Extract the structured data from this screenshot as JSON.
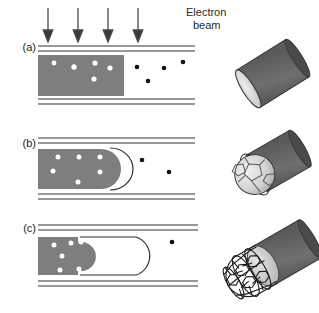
{
  "figure": {
    "type": "schematic-diagram",
    "beam": {
      "label_line1": "Electron",
      "label_line2": "beam",
      "arrow_count": 4,
      "direction": "down",
      "arrow_x": [
        48,
        78,
        108,
        138
      ]
    },
    "panels": [
      {
        "letter": "(a)",
        "state": "flat-filled",
        "inner_particles": 5,
        "outer_particles": 4,
        "description": "Tube filled with flat-ended metal slab; light particles inside, dark particles in the empty tube volume"
      },
      {
        "letter": "(b)",
        "state": "rounded-cap",
        "inner_particles": 6,
        "outer_particles": 2,
        "description": "Slab end rounds off and a curved graphitic cap forms just ahead of it"
      },
      {
        "letter": "(c)",
        "state": "retracted-capsule",
        "inner_particles": 6,
        "outer_particles": 1,
        "description": "Material retracts leaving an elongated closed capsule cavity ahead of the rounded end"
      }
    ],
    "models": [
      {
        "for_panel": "(a)",
        "name": "plain-cylinder",
        "description": "Dark grey cylinder with a pale flat elliptical end face"
      },
      {
        "for_panel": "(b)",
        "name": "cylinder-with-fullerene-cap",
        "description": "Cylinder end capped by a pale pentagon-faceted fullerene ball in a wire cage"
      },
      {
        "for_panel": "(c)",
        "name": "nanotube-sheath",
        "description": "Hexagonal carbon mesh sheath extended over the cylinder end"
      }
    ],
    "colors": {
      "fill_grey": "#7e7e7e",
      "wall_line": "#3a3a3a",
      "particle_light": "#ffffff",
      "particle_dark": "#121212",
      "model_body": "#6e6e6e",
      "model_body_dark": "#4e4e4e",
      "model_cap_light": "#d8d8d8",
      "background": "#ffffff"
    }
  }
}
